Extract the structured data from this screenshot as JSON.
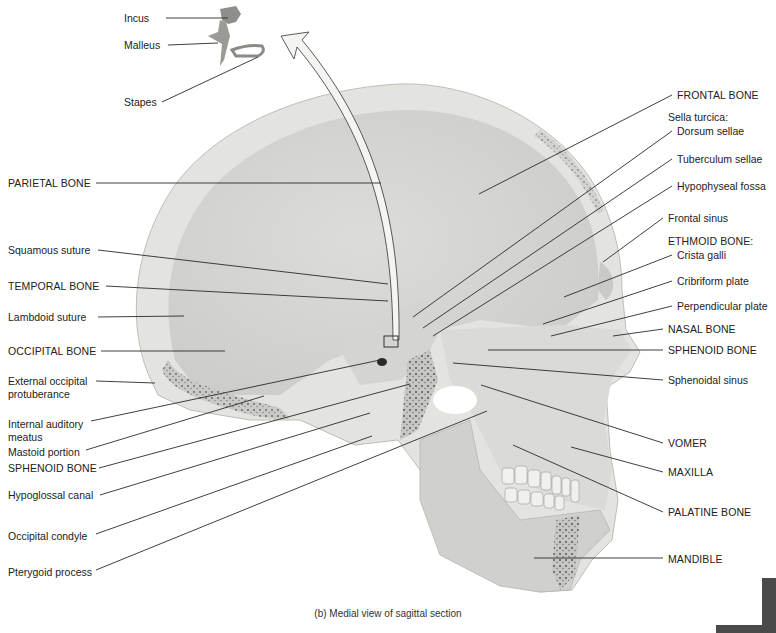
{
  "figure": {
    "caption": "(b) Medial view of sagittal section",
    "colors": {
      "bone_light": "#e6e6e4",
      "bone_mid": "#d2d2cf",
      "bone_dark": "#b9b9b5",
      "bone_inner": "#c9c9c6",
      "spongy": "#8a8a86",
      "leader": "#2a2a2a",
      "corner_tab": "#4a4a4a"
    },
    "ossicles": [
      {
        "text": "Incus",
        "x": 124,
        "y": 12,
        "line": [
          166,
          18,
          228,
          18
        ]
      },
      {
        "text": "Malleus",
        "x": 124,
        "y": 39,
        "line": [
          168,
          45,
          218,
          43
        ]
      },
      {
        "text": "Stapes",
        "x": 124,
        "y": 96,
        "line": [
          162,
          102,
          258,
          57
        ]
      }
    ],
    "labels_left": [
      {
        "text": "PARIETAL BONE",
        "x": 8,
        "y": 177,
        "caps": true,
        "line": [
          96,
          183,
          381,
          183
        ]
      },
      {
        "text": "Squamous suture",
        "x": 8,
        "y": 244,
        "caps": false,
        "line": [
          98,
          250,
          388,
          284
        ]
      },
      {
        "text": "TEMPORAL BONE",
        "x": 8,
        "y": 280,
        "caps": true,
        "line": [
          106,
          286,
          388,
          301
        ]
      },
      {
        "text": "Lambdoid suture",
        "x": 8,
        "y": 311,
        "caps": false,
        "line": [
          98,
          317,
          184,
          316
        ]
      },
      {
        "text": "OCCIPITAL BONE",
        "x": 8,
        "y": 345,
        "caps": true,
        "line": [
          101,
          351,
          225,
          351
        ]
      },
      {
        "text": "External occipital",
        "x": 8,
        "y": 375,
        "caps": false,
        "line": [
          96,
          381,
          155,
          383
        ]
      },
      {
        "text": "protuberance",
        "x": 8,
        "y": 388,
        "caps": false,
        "line": null
      },
      {
        "text": "Internal auditory",
        "x": 8,
        "y": 418,
        "caps": false,
        "line": [
          91,
          421,
          380,
          360
        ]
      },
      {
        "text": "meatus",
        "x": 8,
        "y": 431,
        "caps": false,
        "line": null
      },
      {
        "text": "Mastoid portion",
        "x": 8,
        "y": 446,
        "caps": false,
        "line": [
          86,
          450,
          264,
          396
        ]
      },
      {
        "text": "SPHENOID BONE",
        "x": 8,
        "y": 462,
        "caps": true,
        "line": [
          99,
          468,
          410,
          384
        ]
      },
      {
        "text": "Hypoglossal canal",
        "x": 8,
        "y": 489,
        "caps": false,
        "line": [
          100,
          495,
          370,
          413
        ]
      },
      {
        "text": "Occipital condyle",
        "x": 8,
        "y": 530,
        "caps": false,
        "line": [
          96,
          534,
          372,
          436
        ]
      },
      {
        "text": "Pterygoid process",
        "x": 8,
        "y": 566,
        "caps": false,
        "line": [
          96,
          570,
          487,
          411
        ]
      }
    ],
    "labels_right": [
      {
        "text": "FRONTAL BONE",
        "x": 677,
        "y": 89,
        "caps": true,
        "line": [
          672,
          95,
          479,
          194
        ]
      },
      {
        "text": "Sella turcica:",
        "x": 668,
        "y": 111,
        "caps": false,
        "line": null
      },
      {
        "text": "Dorsum sellae",
        "x": 677,
        "y": 125,
        "caps": false,
        "line": [
          672,
          131,
          413,
          317
        ]
      },
      {
        "text": "Tuberculum sellae",
        "x": 677,
        "y": 153,
        "caps": false,
        "line": [
          672,
          159,
          423,
          328
        ]
      },
      {
        "text": "Hypophyseal fossa",
        "x": 677,
        "y": 180,
        "caps": false,
        "line": [
          672,
          186,
          433,
          336
        ]
      },
      {
        "text": "Frontal sinus",
        "x": 668,
        "y": 212,
        "caps": false,
        "line": [
          663,
          218,
          603,
          262
        ]
      },
      {
        "text": "ETHMOID BONE:",
        "x": 668,
        "y": 235,
        "caps": true,
        "line": null
      },
      {
        "text": "Crista galli",
        "x": 677,
        "y": 249,
        "caps": false,
        "line": [
          672,
          255,
          564,
          297
        ]
      },
      {
        "text": "Cribriform plate",
        "x": 677,
        "y": 275,
        "caps": false,
        "line": [
          672,
          281,
          543,
          324
        ]
      },
      {
        "text": "Perpendicular plate",
        "x": 677,
        "y": 300,
        "caps": false,
        "line": [
          672,
          306,
          551,
          336
        ]
      },
      {
        "text": "NASAL BONE",
        "x": 668,
        "y": 323,
        "caps": true,
        "line": [
          663,
          329,
          613,
          336
        ]
      },
      {
        "text": "SPHENOID BONE",
        "x": 668,
        "y": 344,
        "caps": true,
        "line": [
          663,
          350,
          488,
          350
        ]
      },
      {
        "text": "Sphenoidal sinus",
        "x": 668,
        "y": 374,
        "caps": false,
        "line": [
          663,
          380,
          453,
          363
        ]
      },
      {
        "text": "VOMER",
        "x": 668,
        "y": 437,
        "caps": true,
        "line": [
          663,
          443,
          481,
          385
        ]
      },
      {
        "text": "MAXILLA",
        "x": 668,
        "y": 466,
        "caps": true,
        "line": [
          663,
          472,
          571,
          447
        ]
      },
      {
        "text": "PALATINE BONE",
        "x": 668,
        "y": 506,
        "caps": true,
        "line": [
          663,
          512,
          513,
          445
        ]
      },
      {
        "text": "MANDIBLE",
        "x": 668,
        "y": 553,
        "caps": true,
        "line": [
          663,
          558,
          534,
          558
        ]
      }
    ]
  }
}
